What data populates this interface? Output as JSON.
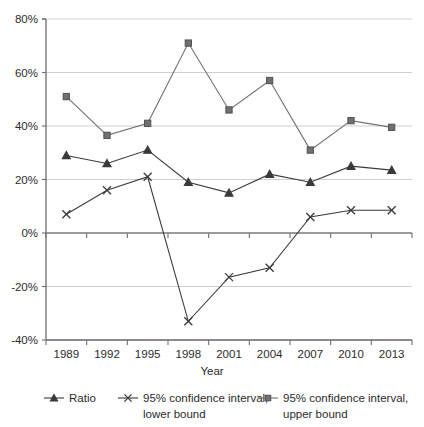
{
  "chart_data": {
    "type": "line",
    "title": "",
    "xlabel": "Year",
    "ylabel": "",
    "categories": [
      "1989",
      "1992",
      "1995",
      "1998",
      "2001",
      "2004",
      "2007",
      "2010",
      "2013"
    ],
    "x": [
      1989,
      1992,
      1995,
      1998,
      2001,
      2004,
      2007,
      2010,
      2013
    ],
    "ylim": [
      -40,
      80
    ],
    "ytick_values": [
      80,
      60,
      40,
      20,
      0,
      -20,
      -40
    ],
    "ytick_labels": [
      "80%",
      "60%",
      "40%",
      "20%",
      "0%",
      "-20%",
      "-40%"
    ],
    "grid": true,
    "grid_axis": "y",
    "legend_position": "bottom",
    "value_unit": "percent",
    "series": [
      {
        "name": "Ratio",
        "marker": "triangle",
        "color": "#3a3a3a",
        "values": [
          29,
          26,
          31,
          19,
          15,
          22,
          19,
          25,
          23.5
        ]
      },
      {
        "name": "95% confidence interval, lower bound",
        "marker": "x",
        "color": "#3a3a3a",
        "values": [
          7,
          16,
          21,
          -33,
          -16.5,
          -13,
          6,
          8.5,
          8.5
        ]
      },
      {
        "name": "95% confidence interval, upper bound",
        "marker": "square",
        "color": "#707070",
        "values": [
          51,
          36.5,
          41,
          71,
          46,
          57,
          31,
          42,
          39.5
        ]
      }
    ]
  },
  "legend": {
    "items": [
      {
        "label_line1": "Ratio",
        "label_line2": "",
        "marker": "triangle"
      },
      {
        "label_line1": "95% confidence interval,",
        "label_line2": "lower bound",
        "marker": "x"
      },
      {
        "label_line1": "95% confidence interval,",
        "label_line2": "upper bound",
        "marker": "square"
      }
    ]
  },
  "axis": {
    "x_title": "Year"
  }
}
